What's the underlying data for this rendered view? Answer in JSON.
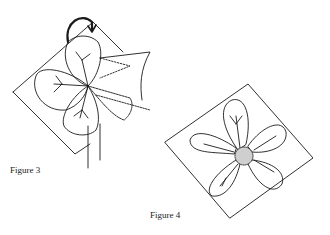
{
  "figures": [
    {
      "id": "figure-3",
      "caption": "Figure 3",
      "description": "Square paper folded around a four-petal shape held by hand, with curved rotation arrow above"
    },
    {
      "id": "figure-4",
      "caption": "Figure 4",
      "description": "Five-petal flower with stippled center on a tilted square of paper"
    }
  ],
  "colors": {
    "ink": "#1a1a1a",
    "background": "#ffffff"
  }
}
